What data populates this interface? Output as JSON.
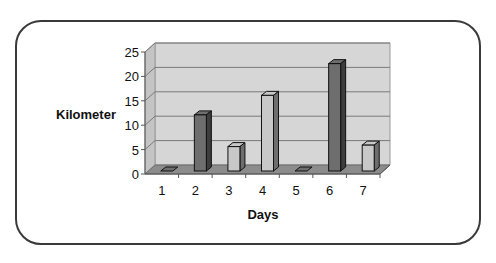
{
  "chart_data": {
    "type": "bar",
    "style": "3d-column",
    "title": "",
    "xlabel": "Days",
    "ylabel": "Kilometer",
    "categories": [
      "1",
      "2",
      "3",
      "4",
      "5",
      "6",
      "7"
    ],
    "values": [
      0,
      11.5,
      5,
      15.5,
      0,
      22,
      5.3
    ],
    "bar_colors": [
      "#6e6e6e",
      "#6e6e6e",
      "#c8c8c8",
      "#c8c8c8",
      "#6e6e6e",
      "#6e6e6e",
      "#c8c8c8"
    ],
    "ylim": [
      0,
      25
    ],
    "yticks": [
      0,
      5,
      10,
      15,
      20,
      25
    ],
    "grid": true,
    "legend": null
  },
  "colors": {
    "wall": "#d6d6d6",
    "side_wall": "#c4c4c4",
    "floor": "#8c8c8c",
    "gridline": "#7a7a7a",
    "frame": "#3a3a3a"
  }
}
